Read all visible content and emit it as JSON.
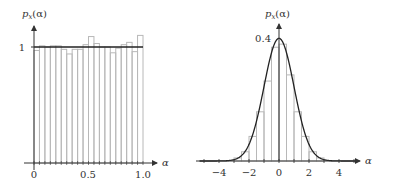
{
  "chart_data": [
    {
      "type": "bar",
      "title": "",
      "xlabel": "α",
      "ylabel": "p_x(α)",
      "xlim": [
        0,
        1.0
      ],
      "ylim": [
        0,
        1.2
      ],
      "xticks": [
        "0",
        "0.5",
        "1.0"
      ],
      "yticks": [
        "1"
      ],
      "bin_width": 0.05,
      "bins": [
        0.0,
        0.05,
        0.1,
        0.15,
        0.2,
        0.25,
        0.3,
        0.35,
        0.4,
        0.45,
        0.5,
        0.55,
        0.6,
        0.65,
        0.7,
        0.75,
        0.8,
        0.85,
        0.9,
        0.95
      ],
      "values": [
        0.97,
        1.01,
        1.0,
        1.01,
        1.01,
        0.98,
        0.94,
        0.98,
        0.98,
        1.02,
        1.09,
        1.03,
        1.0,
        1.0,
        0.95,
        0.99,
        1.02,
        1.04,
        0.96,
        1.1
      ],
      "overlay_curve": {
        "name": "uniform pdf",
        "y": 1.0,
        "range": [
          0,
          1.0
        ]
      }
    },
    {
      "type": "bar",
      "title": "",
      "xlabel": "α",
      "ylabel": "p_x(α)",
      "xlim": [
        -5,
        5
      ],
      "ylim": [
        0,
        0.45
      ],
      "xticks": [
        "−4",
        "−2",
        "0",
        "2",
        "4"
      ],
      "yticks": [
        "0.4"
      ],
      "bin_width": 0.5,
      "bins": [
        -3.0,
        -2.5,
        -2.0,
        -1.5,
        -1.0,
        -0.5,
        0.0,
        0.5,
        1.0,
        1.5,
        2.0,
        2.5
      ],
      "values": [
        0.01,
        0.03,
        0.08,
        0.16,
        0.26,
        0.37,
        0.38,
        0.28,
        0.16,
        0.08,
        0.03,
        0.01
      ],
      "overlay_curve": {
        "name": "gaussian pdf",
        "mean": 0,
        "std": 1
      }
    }
  ],
  "left_chart": {
    "ylabel": "p",
    "ylabel_sub": "x",
    "ylabel_arg": "(α)",
    "ytick": "1",
    "xticks": [
      "0",
      "0.5",
      "1.0"
    ],
    "xlabel": "α"
  },
  "right_chart": {
    "ylabel": "p",
    "ylabel_sub": "x",
    "ylabel_arg": "(α)",
    "ytick": "0.4",
    "xticks": [
      "−4",
      "−2",
      "0",
      "2",
      "4"
    ],
    "xlabel": "α"
  },
  "colors": {
    "bar_stroke": "#b8b8b8",
    "curve": "#222222",
    "axis": "#333333"
  }
}
